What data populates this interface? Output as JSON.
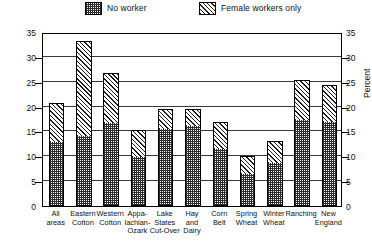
{
  "legend": {
    "items": [
      {
        "label": "No worker",
        "pattern": "dots"
      },
      {
        "label": "Female workers only",
        "pattern": "diagonal"
      }
    ]
  },
  "axis": {
    "y_title_left": "Percent",
    "y_title_right": "Percent",
    "ticks": [
      "0",
      "5",
      "10",
      "15",
      "20",
      "25",
      "30",
      "35"
    ]
  },
  "chart_data": {
    "type": "bar",
    "title": "",
    "subtitle": "",
    "xlabel": "",
    "ylabel": "Percent",
    "ylim": [
      0,
      35
    ],
    "ytick_values": [
      0,
      5,
      10,
      15,
      20,
      25,
      30,
      35
    ],
    "grid": true,
    "stacked": true,
    "legend_position": "top",
    "categories": [
      "All areas",
      "Eastern Cotton",
      "Western Cotton",
      "Appa-lachian-Ozark",
      "Lake States Cut-Over",
      "Hay and Dairy",
      "Corn Belt",
      "Spring Wheat",
      "Winter Wheat",
      "Ranching",
      "New England"
    ],
    "category_lines": [
      [
        "All",
        "areas"
      ],
      [
        "Eastern",
        "Cotton"
      ],
      [
        "Western",
        "Cotton"
      ],
      [
        "Appa-",
        "lachian-",
        "Ozark"
      ],
      [
        "Lake",
        "States",
        "Cut-Over"
      ],
      [
        "Hay",
        "and",
        "Dairy"
      ],
      [
        "Corn",
        "Belt"
      ],
      [
        "Spring",
        "Wheat"
      ],
      [
        "Winter",
        "Wheat"
      ],
      [
        "Ranching"
      ],
      [
        "New",
        "England"
      ]
    ],
    "series": [
      {
        "name": "No worker",
        "values": [
          12.9,
          14.1,
          16.7,
          9.8,
          15.5,
          16.0,
          11.5,
          6.5,
          8.7,
          17.3,
          16.9
        ]
      },
      {
        "name": "Female workers only",
        "values": [
          7.8,
          19.1,
          10.1,
          5.4,
          4.0,
          3.5,
          5.5,
          3.5,
          4.3,
          8.0,
          7.4
        ]
      }
    ],
    "totals": [
      20.7,
      33.2,
      26.8,
      15.2,
      19.5,
      19.5,
      17.0,
      10.0,
      13.0,
      25.3,
      24.3
    ]
  }
}
